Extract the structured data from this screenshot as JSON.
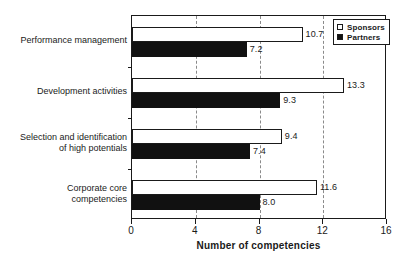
{
  "chart_data": {
    "type": "bar",
    "orientation": "horizontal",
    "title": "",
    "xlabel": "Number of competencies",
    "ylabel": "",
    "xlim": [
      0,
      16
    ],
    "xticks": [
      0,
      4,
      8,
      12,
      16
    ],
    "xtick_labels": [
      "0",
      "4",
      "8",
      "12",
      "16"
    ],
    "gridlines": [
      4,
      8,
      12
    ],
    "grid": true,
    "grid_style": "dashed",
    "legend_position": "top-right-inside",
    "categories": [
      "Performance management",
      "Development activities",
      "Selection and identification\nof high potentials",
      "Corporate core\ncompetencies"
    ],
    "series": [
      {
        "name": "Sponsors",
        "color": "#ffffff",
        "edge_color": "#1a1a1a",
        "values": [
          10.7,
          13.3,
          9.4,
          11.6
        ],
        "value_labels": [
          "10.7",
          "13.3",
          "9.4",
          "11.6"
        ]
      },
      {
        "name": "Partners",
        "color": "#111111",
        "edge_color": "#111111",
        "values": [
          7.2,
          9.3,
          7.4,
          8.0
        ],
        "value_labels": [
          "7.2",
          "9.3",
          "7.4",
          "8.0"
        ]
      }
    ]
  },
  "legend": {
    "items": [
      {
        "label": "Sponsors",
        "swatch": "hollow-square-icon"
      },
      {
        "label": "Partners",
        "swatch": "filled-square-icon"
      }
    ]
  }
}
